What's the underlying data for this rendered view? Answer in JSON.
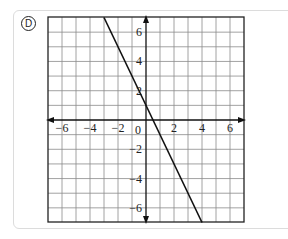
{
  "choice": {
    "letter": "D"
  },
  "chart_data": {
    "type": "line",
    "title": "",
    "xlabel": "",
    "ylabel": "",
    "xlim": [
      -7,
      7
    ],
    "ylim": [
      -7,
      7
    ],
    "grid": true,
    "grid_step": 1,
    "x_ticks": [
      -6,
      -4,
      -2,
      0,
      2,
      4,
      6
    ],
    "y_ticks": [
      -6,
      -4,
      -2,
      2,
      4,
      6
    ],
    "x_tick_labels": [
      "−6",
      "−4",
      "−2",
      "0",
      "2",
      "4",
      "6"
    ],
    "y_tick_labels": [
      "6",
      "4",
      "2",
      "−2",
      "−4",
      "−6"
    ],
    "series": [
      {
        "name": "y = -2x + 1",
        "slope": -2,
        "intercept": 1,
        "points": [
          [
            -3,
            7
          ],
          [
            0,
            1
          ],
          [
            0.5,
            0
          ],
          [
            4,
            -7
          ]
        ]
      }
    ]
  }
}
